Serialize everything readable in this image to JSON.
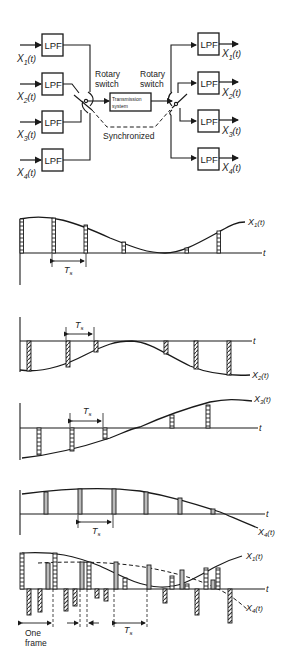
{
  "block_diagram": {
    "inputs": [
      {
        "signal": "X",
        "sub": "1",
        "arg": "(t)",
        "filter": "LPF"
      },
      {
        "signal": "X",
        "sub": "2",
        "arg": "(t)",
        "filter": "LPF"
      },
      {
        "signal": "X",
        "sub": "3",
        "arg": "(t)",
        "filter": "LPF"
      },
      {
        "signal": "X",
        "sub": "4",
        "arg": "(t)",
        "filter": "LPF"
      }
    ],
    "outputs": [
      {
        "signal": "X",
        "sub": "1",
        "arg": "(t)",
        "filter": "LPF"
      },
      {
        "signal": "X",
        "sub": "2",
        "arg": "(t)",
        "filter": "LPF"
      },
      {
        "signal": "X",
        "sub": "3",
        "arg": "(t)",
        "filter": "LPF"
      },
      {
        "signal": "X",
        "sub": "4",
        "arg": "(t)",
        "filter": "LPF"
      }
    ],
    "left_switch_line1": "Rotary",
    "left_switch_line2": "switch",
    "right_switch_line1": "Rotary",
    "right_switch_line2": "switch",
    "channel_line1": "Transmission",
    "channel_line2": "system",
    "sync_label": "Synchronized"
  },
  "waveforms": {
    "time_axis": "t",
    "sample_period": "T",
    "sample_period_sub": "s",
    "x1": {
      "signal": "X",
      "sub": "1",
      "arg": "(t)"
    },
    "x2": {
      "signal": "X",
      "sub": "2",
      "arg": "(t)"
    },
    "x3": {
      "signal": "X",
      "sub": "3",
      "arg": "(t)"
    },
    "x4": {
      "signal": "X",
      "sub": "4",
      "arg": "(t)"
    },
    "combined_x1": {
      "signal": "X",
      "sub": "1",
      "arg": "(t)"
    },
    "combined_x4": {
      "signal": "X",
      "sub": "4",
      "arg": "(t)"
    },
    "frame_line1": "One",
    "frame_line2": "frame"
  }
}
